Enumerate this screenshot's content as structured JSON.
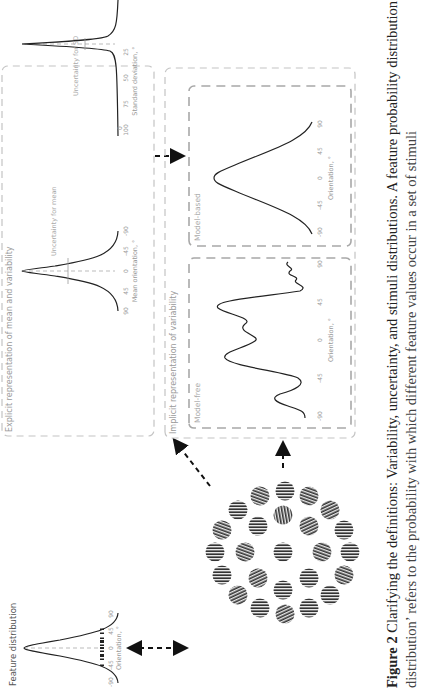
{
  "figure": {
    "number_label": "Figure 2",
    "caption_line1": "Clarifying the definitions: Variability, uncertainty, and stimuli distributions. A feature probability distribution or ‘feature",
    "caption_line2": "distribution’ refers to the probability with which different feature values occur in a set of stimuli"
  },
  "panels": {
    "feature_distribution": {
      "title": "Feature distribution",
      "xlabel": "Orientation, °",
      "ticks": [
        "-90",
        "-45",
        "0",
        "45",
        "90"
      ]
    },
    "explicit": {
      "title": "Explicit representation of mean and variability",
      "mean_plot": {
        "xlabel": "Mean orientation, °",
        "ticks": [
          "-90",
          "-45",
          "0",
          "45",
          "90"
        ],
        "annotation": "Uncertainty for mean"
      },
      "sd_plot": {
        "xlabel": "Standard deviation, °",
        "ticks": [
          "0",
          "25",
          "50",
          "75",
          "100"
        ],
        "annotation": "Uncertainty for SD"
      }
    },
    "implicit": {
      "title": "Implicit representation of variability",
      "model_free": {
        "label": "Model-free",
        "xlabel": "Orientation, °",
        "ticks": [
          "-90",
          "-45",
          "0",
          "45",
          "90"
        ]
      },
      "model_based": {
        "label": "Model-based",
        "xlabel": "Orientation, °",
        "ticks": [
          "-90",
          "-45",
          "0",
          "45",
          "90"
        ]
      }
    },
    "stimuli": {
      "label": "Gabor/grating stimulus array"
    }
  },
  "colors": {
    "curve": "#222222",
    "panel_border": "#bdbdbd",
    "inner_border": "#a8a8a8",
    "label_text": "#9a9a9a",
    "arrow": "#111111"
  }
}
